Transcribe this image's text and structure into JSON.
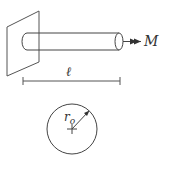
{
  "figure": {
    "labels": {
      "moment": "M",
      "length": "ℓ",
      "radius_main": "r",
      "radius_sub": "o"
    },
    "colors": {
      "stroke": "#444444",
      "background": "#ffffff"
    }
  }
}
